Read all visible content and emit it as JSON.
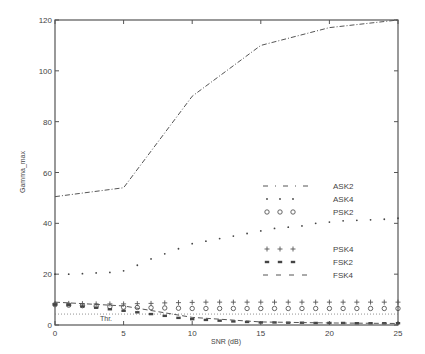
{
  "chart_data": {
    "type": "line",
    "title": "",
    "xlabel": "SNR  (dB)",
    "ylabel": "Gamma_max",
    "xlim": [
      0,
      25
    ],
    "ylim": [
      0,
      120
    ],
    "x_ticks": [
      0,
      5,
      10,
      15,
      20,
      25
    ],
    "y_ticks": [
      0,
      20,
      40,
      60,
      80,
      100,
      120
    ],
    "grid": false,
    "legend_position": "center-right",
    "threshold": {
      "label": "Thr.",
      "value": 4.3
    },
    "series": [
      {
        "name": "ASK2",
        "style": "dash-dot",
        "x": [
          0,
          5,
          10,
          15,
          20,
          25
        ],
        "values": [
          50.5,
          54,
          90,
          110,
          117,
          120
        ]
      },
      {
        "name": "ASK4",
        "style": "dotted-points",
        "x": [
          0,
          1,
          2,
          3,
          4,
          5,
          6,
          7,
          8,
          9,
          10,
          11,
          12,
          13,
          14,
          15,
          16,
          17,
          18,
          19,
          20,
          21,
          22,
          23,
          24,
          25
        ],
        "values": [
          20,
          20,
          20.2,
          20.5,
          20.7,
          21.3,
          23.5,
          26,
          28,
          30,
          32,
          33,
          34,
          35,
          36,
          37,
          38,
          38.5,
          39,
          40,
          40.5,
          41,
          41.2,
          41.4,
          41.6,
          42
        ]
      },
      {
        "name": "PSK2",
        "style": "circle",
        "x": [
          0,
          1,
          2,
          3,
          4,
          5,
          6,
          7,
          8,
          9,
          10,
          11,
          12,
          13,
          14,
          15,
          16,
          17,
          18,
          19,
          20,
          21,
          22,
          23,
          24,
          25
        ],
        "values": [
          8,
          7.8,
          7.6,
          7.4,
          7.2,
          7,
          6.9,
          6.8,
          6.7,
          6.6,
          6.5,
          6.5,
          6.5,
          6.5,
          6.5,
          6.5,
          6.5,
          6.5,
          6.5,
          6.5,
          6.5,
          6.5,
          6.5,
          6.5,
          6.5,
          6.5
        ]
      },
      {
        "name": "PSK4",
        "style": "plus",
        "x": [
          0,
          1,
          2,
          3,
          4,
          5,
          6,
          7,
          8,
          9,
          10,
          11,
          12,
          13,
          14,
          15,
          16,
          17,
          18,
          19,
          20,
          21,
          22,
          23,
          24,
          25
        ],
        "values": [
          8.5,
          8.5,
          8.4,
          8.3,
          8.3,
          8.3,
          8.4,
          8.5,
          8.7,
          8.8,
          8.9,
          9,
          9,
          9,
          9,
          9,
          9,
          9,
          9,
          9,
          9,
          9,
          9,
          9,
          9,
          9
        ]
      },
      {
        "name": "FSK2",
        "style": "star",
        "x": [
          0,
          1,
          2,
          3,
          4,
          5,
          6,
          7,
          8,
          9,
          10,
          11,
          12,
          13,
          14,
          15,
          16,
          17,
          18,
          19,
          20,
          21,
          22,
          23,
          24,
          25
        ],
        "values": [
          8,
          7.8,
          7.3,
          6.8,
          6.2,
          5.6,
          5,
          4.3,
          3.6,
          2.8,
          2.3,
          2,
          1.7,
          1.4,
          1.2,
          1,
          1,
          0.9,
          0.9,
          0.8,
          0.8,
          0.8,
          0.7,
          0.7,
          0.7,
          0.7
        ]
      },
      {
        "name": "FSK4",
        "style": "dashed",
        "x": [
          0,
          5,
          10,
          15,
          20,
          25
        ],
        "values": [
          9,
          7.5,
          3,
          1.2,
          0.8,
          0.6
        ]
      }
    ]
  },
  "labels": {
    "xlabel": "SNR  (dB)",
    "ylabel": "Gamma_max",
    "threshold": "Thr.",
    "x_ticks": [
      "0",
      "5",
      "10",
      "15",
      "20",
      "25"
    ],
    "y_ticks": [
      "0",
      "20",
      "40",
      "60",
      "80",
      "100",
      "120"
    ],
    "legend": [
      "ASK2",
      "ASK4",
      "PSK2",
      "PSK4",
      "FSK2",
      "FSK4"
    ]
  }
}
